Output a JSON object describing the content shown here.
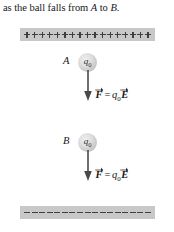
{
  "caption": {
    "prefix": "as the ball falls from ",
    "point_a": "A",
    "middle": " to ",
    "point_b": "B",
    "suffix": "."
  },
  "diagram": {
    "top_plate": {
      "name": "positively-charged-plate",
      "charge_sign": "+",
      "charge_count": 17,
      "color": "#c8c8c8"
    },
    "bottom_plate": {
      "name": "negatively-charged-plate",
      "charge_sign": "-",
      "charge_count": 17,
      "color": "#c8c8c8"
    },
    "balls": [
      {
        "point_label": "A",
        "charge_symbol": "q",
        "charge_subscript": "0",
        "color": "#d2d2d2"
      },
      {
        "point_label": "B",
        "charge_symbol": "q",
        "charge_subscript": "0",
        "color": "#d2d2d2"
      }
    ],
    "forces": [
      {
        "force_symbol": "F",
        "equals": "=",
        "charge_symbol": "q",
        "charge_subscript": "0",
        "field_symbol": "E",
        "direction": "down"
      },
      {
        "force_symbol": "F",
        "equals": "=",
        "charge_symbol": "q",
        "charge_subscript": "0",
        "field_symbol": "E",
        "direction": "down"
      }
    ],
    "arrow_color": "#4a4a4e"
  }
}
